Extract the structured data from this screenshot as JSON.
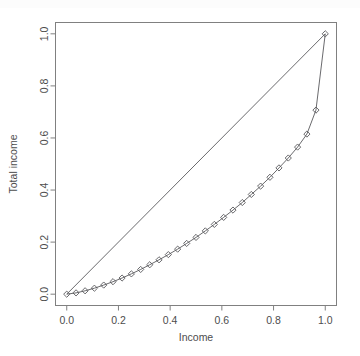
{
  "chart_data": {
    "type": "line",
    "title": "",
    "xlabel": "Income",
    "ylabel": "Total income",
    "xlim": [
      0,
      1
    ],
    "ylim": [
      0,
      1
    ],
    "grid": false,
    "legend": "none",
    "xticks": [
      "0.0",
      "0.2",
      "0.4",
      "0.6",
      "0.8",
      "1.0"
    ],
    "xtick_values": [
      0.0,
      0.2,
      0.4,
      0.6,
      0.8,
      1.0
    ],
    "yticks": [
      "0.0",
      "0.2",
      "0.4",
      "0.6",
      "0.8",
      "1.0"
    ],
    "ytick_values": [
      0.0,
      0.2,
      0.4,
      0.6,
      0.8,
      1.0
    ],
    "series": [
      {
        "name": "line of equality",
        "marker": "none",
        "x": [
          0.0,
          1.0
        ],
        "y": [
          0.0,
          1.0
        ]
      },
      {
        "name": "Lorenz curve",
        "marker": "diamond",
        "x": [
          0.0,
          0.036,
          0.071,
          0.107,
          0.143,
          0.179,
          0.214,
          0.25,
          0.286,
          0.321,
          0.357,
          0.393,
          0.429,
          0.464,
          0.5,
          0.536,
          0.571,
          0.607,
          0.643,
          0.679,
          0.714,
          0.75,
          0.786,
          0.821,
          0.857,
          0.893,
          0.929,
          0.964,
          1.0
        ],
        "y": [
          0.0,
          0.005,
          0.013,
          0.023,
          0.035,
          0.048,
          0.062,
          0.078,
          0.095,
          0.113,
          0.132,
          0.152,
          0.173,
          0.195,
          0.218,
          0.243,
          0.268,
          0.295,
          0.323,
          0.352,
          0.383,
          0.415,
          0.449,
          0.485,
          0.523,
          0.565,
          0.615,
          0.707,
          1.0
        ]
      }
    ]
  },
  "axes": {
    "x_label": "Income",
    "y_label": "Total income"
  }
}
